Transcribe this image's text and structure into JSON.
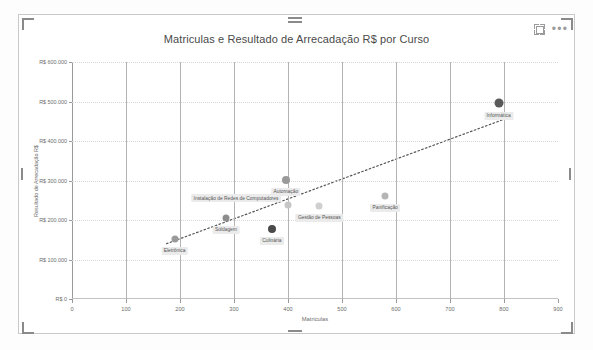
{
  "visual": {
    "icons": {
      "focus": "focus-mode-icon",
      "more": "more-options-icon",
      "more_glyph": "•••"
    }
  },
  "chart_data": {
    "type": "scatter",
    "title": "Matriculas e Resultado de Arrecadação R$ por Curso",
    "xlabel": "Matriculas",
    "ylabel": "Resultado de Arrecadação R$",
    "xlim": [
      0,
      900
    ],
    "ylim": [
      0,
      600000
    ],
    "xticks": [
      "0",
      "100",
      "200",
      "300",
      "400",
      "500",
      "600",
      "700",
      "800",
      "900"
    ],
    "xtick_values": [
      0,
      100,
      200,
      300,
      400,
      500,
      600,
      700,
      800,
      900
    ],
    "yticks": [
      "R$ 0",
      "R$ 100.000",
      "R$ 200.000",
      "R$ 300.000",
      "R$ 400.000",
      "R$ 500.000",
      "R$ 600.000"
    ],
    "ytick_values": [
      0,
      100000,
      200000,
      300000,
      400000,
      500000,
      600000
    ],
    "grid": "vertical solid, horizontal dotted",
    "legend": "none",
    "trendline": {
      "visible": true,
      "style": "dotted",
      "x0": 175,
      "y0": 140000,
      "x1": 800,
      "y1": 455000
    },
    "points": [
      {
        "label": "Eletrônica",
        "x": 190,
        "y": 152000,
        "color": "#9a9a9a",
        "size": 7,
        "label_dx": 0,
        "label_dy": 8
      },
      {
        "label": "Soldagem",
        "x": 285,
        "y": 206000,
        "color": "#8d8d8d",
        "size": 7,
        "label_dx": 0,
        "label_dy": 8
      },
      {
        "label": "Instalação de Redes de Computadores",
        "x": 400,
        "y": 237000,
        "color": "#c6c6c6",
        "size": 7,
        "label_dx": -52,
        "label_dy": -11
      },
      {
        "label": "Automação",
        "x": 396,
        "y": 301000,
        "color": "#9a9a9a",
        "size": 8,
        "label_dx": 0,
        "label_dy": 8
      },
      {
        "label": "Culinária",
        "x": 370,
        "y": 177000,
        "color": "#4a4a4a",
        "size": 8,
        "label_dx": 0,
        "label_dy": 8
      },
      {
        "label": "Gestão de Pessoas",
        "x": 458,
        "y": 236000,
        "color": "#cfcfcf",
        "size": 7,
        "label_dx": 0,
        "label_dy": 8
      },
      {
        "label": "Panificação",
        "x": 580,
        "y": 262000,
        "color": "#b5b5b5",
        "size": 7,
        "label_dx": 0,
        "label_dy": 8
      },
      {
        "label": "Informática",
        "x": 790,
        "y": 496000,
        "color": "#5a5a5a",
        "size": 9,
        "label_dx": 0,
        "label_dy": 9
      }
    ]
  }
}
